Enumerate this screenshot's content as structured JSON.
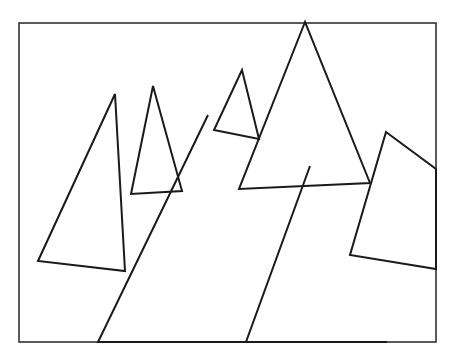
{
  "figure": {
    "width": 451,
    "height": 353,
    "background": "#ffffff",
    "stroke_color": "#1a1a1a",
    "frame_color": "#333333",
    "frame": {
      "x": 19,
      "y": 23,
      "w": 417,
      "h": 319,
      "stroke_width": 1.6
    },
    "shape_stroke_width": 2,
    "shapes": [
      {
        "name": "triangle-left",
        "points": "115,94 38,261 125,271"
      },
      {
        "name": "triangle-small-left",
        "points": "153,86 131,194 182,191"
      },
      {
        "name": "triangle-large-center-left",
        "points": "208,115 98,342 286,342",
        "open_base": true
      },
      {
        "name": "triangle-small-top",
        "points": "242,70 214,130 259,139"
      },
      {
        "name": "triangle-tall-center",
        "points": "305,22 239,189 370,183"
      },
      {
        "name": "triangle-bottom-right",
        "points": "310,166 246,342 387,342",
        "open_base": true
      },
      {
        "name": "quad-right",
        "points": "386,132 436,169 436,269 350,255"
      }
    ]
  }
}
